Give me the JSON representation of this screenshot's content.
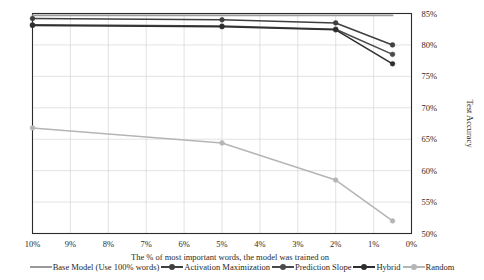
{
  "chart_data": {
    "type": "line",
    "title": "",
    "xlabel": "The % of most important  words, the model was trained on",
    "ylabel": "Test Accuracy",
    "x_tick_labels": [
      "10%",
      "9%",
      "8%",
      "7%",
      "6%",
      "5%",
      "4%",
      "3%",
      "2%",
      "1%",
      "0%"
    ],
    "x_tick_values": [
      10,
      9,
      8,
      7,
      6,
      5,
      4,
      3,
      2,
      1,
      0
    ],
    "xlim": [
      10,
      0
    ],
    "x_axis_reversed": true,
    "y_tick_labels": [
      "50%",
      "55%",
      "60%",
      "65%",
      "70%",
      "75%",
      "80%",
      "85%"
    ],
    "y_tick_values": [
      50,
      55,
      60,
      65,
      70,
      75,
      80,
      85
    ],
    "ylim": [
      50,
      85
    ],
    "y_axis_position": "right",
    "grid": true,
    "legend_position": "bottom",
    "series": [
      {
        "name": "Base Model (Use 100% words)",
        "color": "#9a9a9a",
        "marker": "none",
        "x": [
          10,
          0.5
        ],
        "values": [
          84.7,
          84.7
        ]
      },
      {
        "name": "Activation Maximization",
        "color": "#3f3f3f",
        "marker": "circle",
        "x": [
          10,
          5,
          2,
          0.5
        ],
        "values": [
          84.2,
          84.0,
          83.5,
          80.0
        ]
      },
      {
        "name": "Prediction Slope",
        "color": "#4a4a4a",
        "marker": "circle",
        "x": [
          10,
          5,
          2,
          0.5
        ],
        "values": [
          83.2,
          83.0,
          82.5,
          78.5
        ]
      },
      {
        "name": "Hybrid",
        "color": "#2e2e2e",
        "marker": "circle",
        "x": [
          10,
          5,
          2,
          0.5
        ],
        "values": [
          83.1,
          82.9,
          82.4,
          77.0
        ]
      },
      {
        "name": "Random",
        "color": "#b5b5b5",
        "marker": "circle",
        "x": [
          10,
          5,
          2,
          0.5
        ],
        "values": [
          66.8,
          64.4,
          58.5,
          52.0
        ]
      }
    ]
  },
  "legend": {
    "items": [
      {
        "label": "Base Model (Use 100% words)",
        "color": "#9a9a9a",
        "marker": "none"
      },
      {
        "label": "Activation Maximization",
        "color": "#3f3f3f",
        "marker": "circle"
      },
      {
        "label": "Prediction Slope",
        "color": "#4a4a4a",
        "marker": "circle"
      },
      {
        "label": "Hybrid",
        "color": "#2e2e2e",
        "marker": "circle"
      },
      {
        "label": "Random",
        "color": "#b5b5b5",
        "marker": "circle"
      }
    ]
  }
}
